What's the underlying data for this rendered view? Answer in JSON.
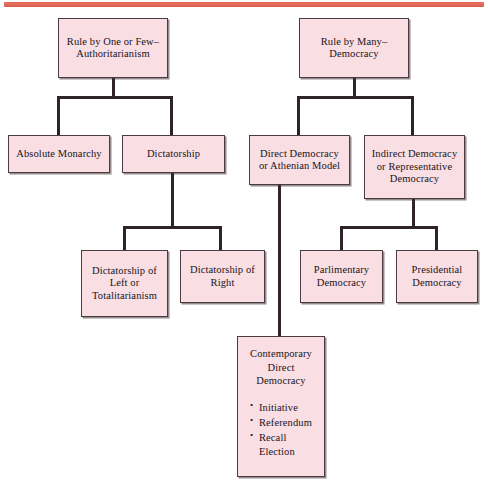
{
  "diagram": {
    "type": "hierarchy-tree",
    "colors": {
      "node_fill": "#f9dee4",
      "node_border": "#4a3b40",
      "connector": "#2e2428",
      "top_rule": "#e2705f",
      "text": "#1a1418"
    },
    "top_rule_label": "decorative-rule"
  },
  "nodes": {
    "authoritarianism": {
      "label": "Rule by One or Few–\nAuthoritarianism"
    },
    "democracy": {
      "label": "Rule by Many–\nDemocracy"
    },
    "absolute_monarchy": {
      "label": "Absolute Monarchy"
    },
    "dictatorship": {
      "label": "Dictatorship"
    },
    "direct_democracy": {
      "label": "Direct Democracy\nor Athenian Model"
    },
    "indirect_democracy": {
      "label": "Indirect Democracy\nor Representative\nDemocracy"
    },
    "dictatorship_left": {
      "label": "Dictatorship of\nLeft or\nTotalitarianism"
    },
    "dictatorship_right": {
      "label": "Dictatorship of\nRight"
    },
    "parliamentary_democracy": {
      "label": "Parlimentary\nDemocracy"
    },
    "presidential_democracy": {
      "label": "Presidential\nDemocracy"
    },
    "contemporary_direct_democracy": {
      "heading": "Contemporary\nDirect\nDemocracy",
      "bullets": [
        "Initiative",
        "Referendum",
        "Recall\nElection"
      ]
    }
  }
}
